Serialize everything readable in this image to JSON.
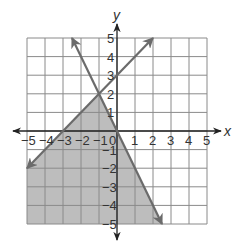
{
  "chart_data": {
    "type": "line",
    "title": "",
    "xlabel": "x",
    "ylabel": "y",
    "xlim": [
      -5,
      5
    ],
    "ylim": [
      -5,
      5
    ],
    "grid": true,
    "x_ticks": [
      -5,
      -4,
      -3,
      -2,
      -1,
      0,
      1,
      2,
      3,
      4,
      5
    ],
    "y_ticks": [
      -5,
      -4,
      -3,
      -2,
      -1,
      1,
      2,
      3,
      4,
      5
    ],
    "x_tick_labels": [
      "−5",
      "−4",
      "−3",
      "−2",
      "−1",
      "0",
      "1",
      "2",
      "3",
      "4",
      "5"
    ],
    "y_tick_labels": [
      "−5",
      "−4",
      "−3",
      "−2",
      "−1",
      "1",
      "2",
      "3",
      "4",
      "5"
    ],
    "series": [
      {
        "name": "y = x + 3",
        "slope": 1,
        "intercept": 3,
        "points": [
          [
            -5,
            -2
          ],
          [
            2,
            5
          ]
        ],
        "arrows": "both",
        "color": "#6b6b6b"
      },
      {
        "name": "y = -2x",
        "slope": -2,
        "intercept": 0,
        "points": [
          [
            -2.5,
            5
          ],
          [
            2.5,
            -5
          ]
        ],
        "arrows": "both",
        "color": "#6b6b6b"
      }
    ],
    "shaded_region": {
      "description": "y <= x + 3 and y <= -2x",
      "vertices": [
        [
          -5,
          -2
        ],
        [
          -1,
          2
        ],
        [
          2.5,
          -5
        ],
        [
          -5,
          -5
        ]
      ],
      "color": "#bdbdbd"
    },
    "intersection": [
      -1,
      2
    ]
  },
  "colors": {
    "grid": "#8a8a8a",
    "axis": "#222222",
    "shade": "#bdbdbd",
    "line": "#6b6b6b"
  }
}
